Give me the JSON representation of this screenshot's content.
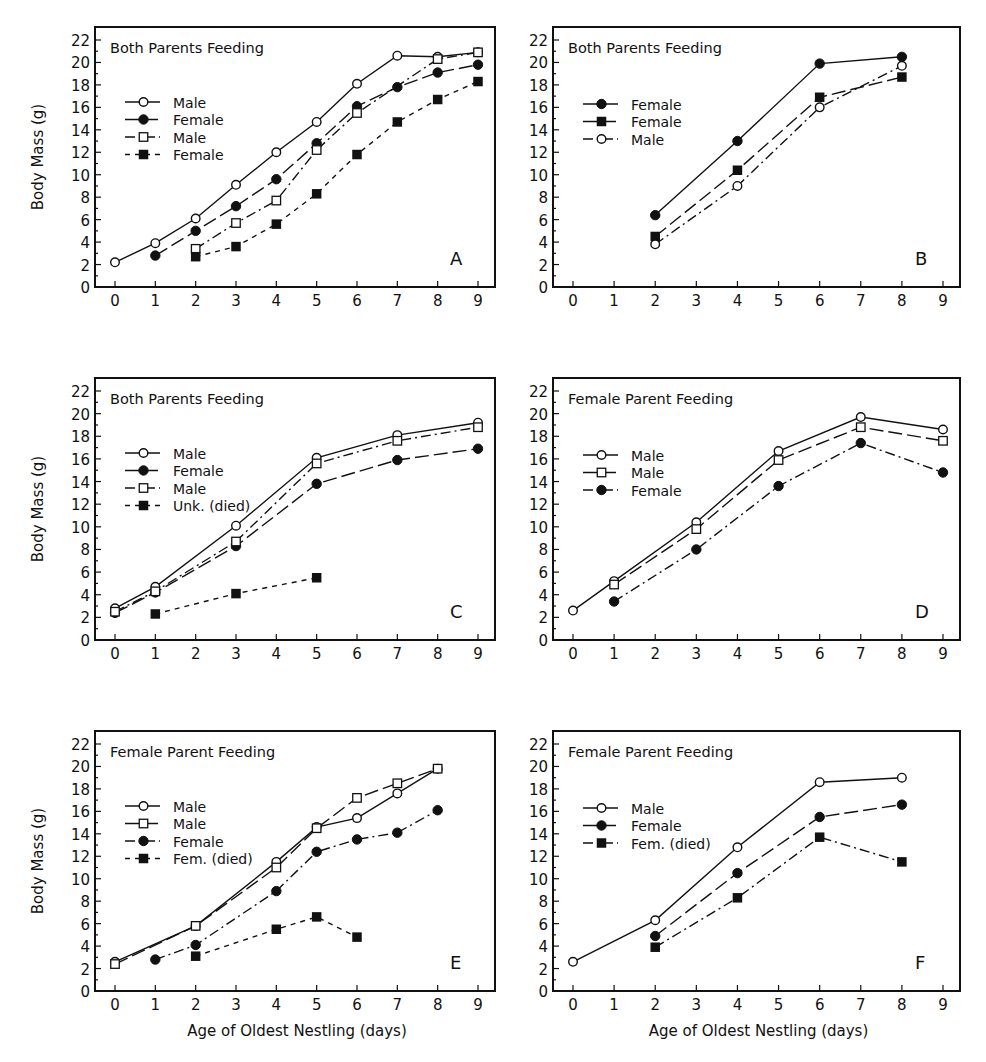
{
  "figure": {
    "y_axis_label": "Body Mass (g)",
    "x_axis_label": "Age of Oldest Nestling (days)",
    "x_ticks": [
      "0",
      "1",
      "2",
      "3",
      "4",
      "5",
      "6",
      "7",
      "8",
      "9"
    ],
    "y_ticks": [
      "0",
      "2",
      "4",
      "6",
      "8",
      "10",
      "12",
      "14",
      "16",
      "18",
      "20",
      "22"
    ],
    "ink_color": "#111111",
    "background": "#ffffff"
  },
  "chart_data": [
    {
      "type": "line",
      "panel": "A",
      "title": "Both Parents Feeding",
      "xlabel": "",
      "ylabel": "Body Mass (g)",
      "xlim": [
        0,
        9
      ],
      "ylim": [
        0,
        22
      ],
      "grid": false,
      "legend_position": "upper-left",
      "series": [
        {
          "name": "Male",
          "marker": "open-circle",
          "line": "solid",
          "x": [
            0,
            1,
            2,
            3,
            4,
            5,
            6,
            7,
            8,
            9
          ],
          "y": [
            2.2,
            3.9,
            6.1,
            9.1,
            12.0,
            14.7,
            18.1,
            20.6,
            20.5,
            20.9
          ]
        },
        {
          "name": "Female",
          "marker": "filled-circle",
          "line": "long-dash",
          "x": [
            1,
            2,
            3,
            4,
            5,
            6,
            7,
            8,
            9
          ],
          "y": [
            2.8,
            5.0,
            7.2,
            9.6,
            12.8,
            16.1,
            17.8,
            19.1,
            19.8
          ]
        },
        {
          "name": "Male",
          "marker": "open-square",
          "line": "dash-dot",
          "x": [
            2,
            3,
            4,
            5,
            6,
            8,
            9
          ],
          "y": [
            3.4,
            5.7,
            7.7,
            12.2,
            15.5,
            20.3,
            20.9
          ]
        },
        {
          "name": "Female",
          "marker": "filled-square",
          "line": "short-dash",
          "x": [
            2,
            3,
            4,
            5,
            6,
            7,
            8,
            9
          ],
          "y": [
            2.7,
            3.6,
            5.6,
            8.3,
            11.8,
            14.7,
            16.7,
            18.3
          ]
        }
      ]
    },
    {
      "type": "line",
      "panel": "B",
      "title": "Both Parents Feeding",
      "xlabel": "",
      "ylabel": "",
      "xlim": [
        0,
        9
      ],
      "ylim": [
        0,
        22
      ],
      "grid": false,
      "legend_position": "upper-left",
      "series": [
        {
          "name": "Female",
          "marker": "filled-circle",
          "line": "solid",
          "x": [
            2,
            4,
            6,
            8
          ],
          "y": [
            6.4,
            13.0,
            19.9,
            20.5
          ]
        },
        {
          "name": "Female",
          "marker": "filled-square",
          "line": "long-dash",
          "x": [
            2,
            4,
            6,
            8
          ],
          "y": [
            4.5,
            10.4,
            16.9,
            18.7
          ]
        },
        {
          "name": "Male",
          "marker": "open-circle",
          "line": "dash-dot",
          "x": [
            2,
            4,
            6,
            8
          ],
          "y": [
            3.8,
            9.0,
            16.0,
            19.7
          ]
        }
      ]
    },
    {
      "type": "line",
      "panel": "C",
      "title": "Both Parents Feeding",
      "xlabel": "",
      "ylabel": "Body Mass (g)",
      "xlim": [
        0,
        9
      ],
      "ylim": [
        0,
        22
      ],
      "grid": false,
      "legend_position": "upper-left",
      "series": [
        {
          "name": "Male",
          "marker": "open-circle",
          "line": "solid",
          "x": [
            0,
            1,
            3,
            5,
            7,
            9
          ],
          "y": [
            2.8,
            4.7,
            10.1,
            16.1,
            18.1,
            19.2
          ]
        },
        {
          "name": "Female",
          "marker": "filled-circle",
          "line": "long-dash",
          "x": [
            0,
            1,
            3,
            5,
            7,
            9
          ],
          "y": [
            2.4,
            4.2,
            8.3,
            13.8,
            15.9,
            16.9
          ]
        },
        {
          "name": "Male",
          "marker": "open-square",
          "line": "dash-dot",
          "x": [
            0,
            1,
            3,
            5,
            7,
            9
          ],
          "y": [
            2.5,
            4.3,
            8.7,
            15.6,
            17.6,
            18.8
          ]
        },
        {
          "name": "Unk. (died)",
          "marker": "filled-square",
          "line": "short-dash",
          "x": [
            1,
            3,
            5
          ],
          "y": [
            2.3,
            4.1,
            5.5
          ]
        }
      ]
    },
    {
      "type": "line",
      "panel": "D",
      "title": "Female Parent Feeding",
      "xlabel": "",
      "ylabel": "",
      "xlim": [
        0,
        9
      ],
      "ylim": [
        0,
        22
      ],
      "grid": false,
      "legend_position": "upper-left",
      "series": [
        {
          "name": "Male",
          "marker": "open-circle",
          "line": "solid",
          "x": [
            0,
            1,
            3,
            5,
            7,
            9
          ],
          "y": [
            2.6,
            5.2,
            10.4,
            16.7,
            19.7,
            18.6
          ]
        },
        {
          "name": "Male",
          "marker": "open-square",
          "line": "long-dash",
          "x": [
            1,
            3,
            5,
            7,
            9
          ],
          "y": [
            4.9,
            9.8,
            15.9,
            18.8,
            17.6
          ]
        },
        {
          "name": "Female",
          "marker": "filled-circle",
          "line": "dash-dot",
          "x": [
            1,
            3,
            5,
            7,
            9
          ],
          "y": [
            3.4,
            8.0,
            13.6,
            17.4,
            14.8
          ]
        }
      ]
    },
    {
      "type": "line",
      "panel": "E",
      "title": "Female Parent Feeding",
      "xlabel": "Age of Oldest Nestling (days)",
      "ylabel": "Body Mass (g)",
      "xlim": [
        0,
        9
      ],
      "ylim": [
        0,
        22
      ],
      "grid": false,
      "legend_position": "upper-left",
      "series": [
        {
          "name": "Male",
          "marker": "open-circle",
          "line": "solid",
          "x": [
            0,
            2,
            4,
            5,
            6,
            7,
            8
          ],
          "y": [
            2.6,
            5.8,
            11.5,
            14.6,
            15.4,
            17.6,
            19.8
          ]
        },
        {
          "name": "Male",
          "marker": "open-square",
          "line": "long-dash",
          "x": [
            0,
            2,
            4,
            5,
            6,
            7,
            8
          ],
          "y": [
            2.4,
            5.8,
            11.0,
            14.5,
            17.2,
            18.5,
            19.8
          ]
        },
        {
          "name": "Female",
          "marker": "filled-circle",
          "line": "dash-dot",
          "x": [
            1,
            2,
            4,
            5,
            6,
            7,
            8
          ],
          "y": [
            2.8,
            4.1,
            8.9,
            12.4,
            13.5,
            14.1,
            16.1
          ]
        },
        {
          "name": "Fem. (died)",
          "marker": "filled-square",
          "line": "short-dash",
          "x": [
            2,
            4,
            5,
            6
          ],
          "y": [
            3.1,
            5.5,
            6.6,
            4.8
          ]
        }
      ]
    },
    {
      "type": "line",
      "panel": "F",
      "title": "Female Parent Feeding",
      "xlabel": "Age of Oldest Nestling (days)",
      "ylabel": "",
      "xlim": [
        0,
        9
      ],
      "ylim": [
        0,
        22
      ],
      "grid": false,
      "legend_position": "upper-left",
      "series": [
        {
          "name": "Male",
          "marker": "open-circle",
          "line": "solid",
          "x": [
            0,
            2,
            4,
            6,
            8
          ],
          "y": [
            2.6,
            6.3,
            12.8,
            18.6,
            19.0
          ]
        },
        {
          "name": "Female",
          "marker": "filled-circle",
          "line": "long-dash",
          "x": [
            2,
            4,
            6,
            8
          ],
          "y": [
            4.9,
            10.5,
            15.5,
            16.6
          ]
        },
        {
          "name": "Fem. (died)",
          "marker": "filled-square",
          "line": "dash-dot",
          "x": [
            2,
            4,
            6,
            8
          ],
          "y": [
            3.9,
            8.3,
            13.7,
            11.5
          ]
        }
      ]
    }
  ]
}
